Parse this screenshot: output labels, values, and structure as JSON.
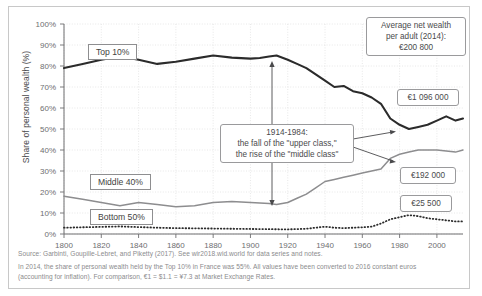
{
  "axes": {
    "ylabel": "Share of personal wealth (%)",
    "yticks": [
      "0%",
      "10%",
      "20%",
      "30%",
      "40%",
      "50%",
      "60%",
      "70%",
      "80%",
      "90%",
      "100%"
    ],
    "xticks": [
      "1800",
      "1820",
      "1840",
      "1860",
      "1880",
      "1900",
      "1920",
      "1940",
      "1960",
      "1980",
      "2000"
    ]
  },
  "series_labels": {
    "top10": "Top 10%",
    "middle40": "Middle 40%",
    "bottom50": "Bottom 50%"
  },
  "callouts": {
    "avg_wealth": "Average net wealth\nper adult (2014):\n€200 800",
    "avg_wealth_line1": "Average net wealth",
    "avg_wealth_line2": "per adult (2014):",
    "avg_wealth_line3": "€200 800",
    "annotation_line1": "1914-1984:",
    "annotation_line2": "the fall of the \"upper class,\"",
    "annotation_line3": "the rise of the \"middle class\"",
    "value_top10": "€1 096 000",
    "value_middle40": "€192 000",
    "value_bottom50": "€25 500"
  },
  "footnotes": {
    "line1": "Source: Garbinti, Goupille-Lebret, and Piketty (2017). See wir2018.wid.world for data series and notes.",
    "line2": "In 2014, the share of personal wealth held by the Top 10% in France was 55%. All values have been converted to 2016 constant euros (accounting for inflation). For comparison, €1 = $1.1 = ¥7.3 at Market Exchange Rates."
  },
  "colors": {
    "top10": "#2b2b2b",
    "middle40": "#8d8d8f",
    "bottom50": "#2b2b2b",
    "grid": "#e2e2e2",
    "axis": "#6e6e70",
    "frame": "#c8c8c8"
  },
  "chart_data": {
    "type": "line",
    "title": "",
    "xlabel": "",
    "ylabel": "Share of personal wealth (%)",
    "xlim": [
      1800,
      2014
    ],
    "ylim": [
      0,
      100
    ],
    "grid": true,
    "legend": "inline-labels",
    "annotations": [
      {
        "text": "1914-1984: the fall of the \"upper class,\" the rise of the \"middle class\"",
        "x": 1914,
        "y_range": [
          40,
          85
        ]
      },
      {
        "text": "Average net wealth per adult (2014): €200 800"
      },
      {
        "text": "€1 096 000",
        "series": "Top 10%",
        "x": 2014
      },
      {
        "text": "€192 000",
        "series": "Middle 40%",
        "x": 2014
      },
      {
        "text": "€25 500",
        "series": "Bottom 50%",
        "x": 2014
      }
    ],
    "series": [
      {
        "name": "Top 10%",
        "style": "solid-thick",
        "x": [
          1800,
          1810,
          1820,
          1830,
          1840,
          1850,
          1860,
          1870,
          1880,
          1890,
          1900,
          1905,
          1910,
          1914,
          1920,
          1925,
          1930,
          1935,
          1940,
          1945,
          1950,
          1955,
          1960,
          1965,
          1970,
          1975,
          1980,
          1985,
          1990,
          1995,
          2000,
          2005,
          2010,
          2014
        ],
        "values": [
          79,
          81,
          83,
          84.5,
          83,
          81,
          82,
          83.5,
          85,
          84,
          83.5,
          83.8,
          84.5,
          85,
          83,
          81,
          79,
          76,
          73,
          70,
          70.5,
          68,
          67,
          65,
          62,
          55,
          52,
          50,
          51,
          52,
          54,
          56,
          54,
          55
        ]
      },
      {
        "name": "Middle 40%",
        "style": "solid-medium",
        "x": [
          1800,
          1810,
          1820,
          1830,
          1840,
          1850,
          1860,
          1870,
          1880,
          1890,
          1900,
          1910,
          1914,
          1920,
          1925,
          1930,
          1935,
          1940,
          1945,
          1950,
          1955,
          1960,
          1965,
          1970,
          1975,
          1980,
          1985,
          1990,
          1995,
          2000,
          2005,
          2010,
          2014
        ],
        "values": [
          18,
          16.5,
          15,
          13.5,
          15,
          14,
          13,
          13.5,
          15,
          15.5,
          15,
          14.5,
          14,
          15,
          17,
          19,
          22,
          25,
          26,
          27,
          28,
          29,
          30,
          31,
          36,
          38,
          39,
          40,
          40,
          40,
          39.5,
          39,
          40
        ]
      },
      {
        "name": "Bottom 50%",
        "style": "dotted",
        "x": [
          1800,
          1810,
          1820,
          1830,
          1840,
          1850,
          1860,
          1870,
          1880,
          1890,
          1900,
          1910,
          1920,
          1930,
          1940,
          1945,
          1950,
          1955,
          1960,
          1965,
          1970,
          1975,
          1980,
          1985,
          1990,
          1995,
          2000,
          2005,
          2010,
          2014
        ],
        "values": [
          3,
          3.2,
          3.4,
          3.6,
          3.3,
          3,
          2.8,
          2.7,
          2.6,
          2.5,
          2.4,
          2.3,
          2.2,
          2.5,
          3.5,
          3,
          2.8,
          3,
          3.2,
          3.5,
          5,
          7,
          8,
          9,
          8.5,
          7.5,
          7,
          6.5,
          6,
          6
        ]
      }
    ]
  }
}
